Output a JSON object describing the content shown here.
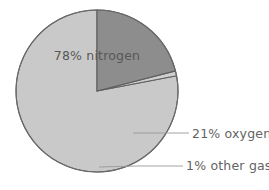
{
  "chart_data": {
    "type": "pie",
    "title": "",
    "subtitle": "",
    "xlabel": "",
    "ylabel": "",
    "legend_position": "none",
    "grid": false,
    "categories": [
      "nitrogen",
      "oxygen",
      "other gases"
    ],
    "values": [
      78,
      21,
      1
    ],
    "unit": "%",
    "slices": [
      {
        "name": "nitrogen",
        "value": 78,
        "label": "78% nitrogen",
        "color": "#c9c9c9",
        "label_placement": "inside"
      },
      {
        "name": "oxygen",
        "value": 21,
        "label": "21% oxygen",
        "color": "#8d8d8d",
        "label_placement": "outside-right-leader"
      },
      {
        "name": "other gases",
        "value": 1,
        "label": "1% other gases",
        "color": "#cfcfcf",
        "label_placement": "outside-right-leader"
      }
    ],
    "start_angle_deg": 0,
    "direction": "clockwise",
    "outline_color": "#5f5f5f",
    "background_color": "#ffffff",
    "leader_line_color": "#9a9a9a",
    "text_color": "#585858"
  },
  "labels": {
    "nitrogen": "78% nitrogen",
    "oxygen": "21% oxygen",
    "other": "1% other gases"
  },
  "geometry": {
    "center_x": 97,
    "center_y": 91,
    "radius": 81
  }
}
